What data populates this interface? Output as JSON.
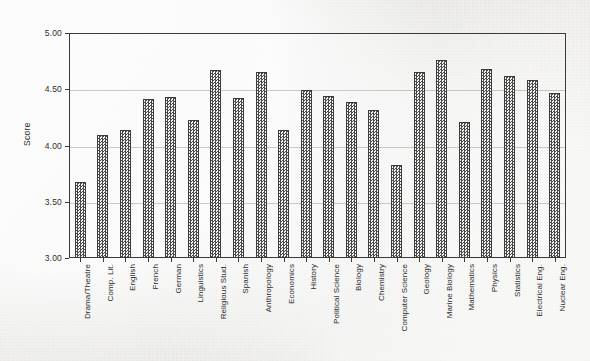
{
  "chart_data": {
    "type": "bar",
    "title": "",
    "xlabel": "",
    "ylabel": "Score",
    "ylim": [
      3.0,
      5.0
    ],
    "yticks": [
      "3.00",
      "3.50",
      "4.00",
      "4.50",
      "5.00"
    ],
    "ytick_values": [
      3.0,
      3.5,
      4.0,
      4.5,
      5.0
    ],
    "grid": true,
    "legend": "none",
    "categories": [
      "Drama/Theatre",
      "Comp. Lit.",
      "English",
      "French",
      "German",
      "Linguistics",
      "Religious Stud.",
      "Spanish",
      "Anthropology",
      "Economics",
      "History",
      "Political Science",
      "Biology",
      "Chemistry",
      "Computer Science",
      "Geology",
      "Marine Biology",
      "Mathematics",
      "Physics",
      "Statistics",
      "Electrical Eng.",
      "Nuclear Eng."
    ],
    "values": [
      3.68,
      4.09,
      4.14,
      4.41,
      4.43,
      4.23,
      4.67,
      4.42,
      4.65,
      4.14,
      4.49,
      4.44,
      4.39,
      4.32,
      3.83,
      4.65,
      4.76,
      4.21,
      4.68,
      4.62,
      4.58,
      4.47
    ]
  },
  "style": {
    "bar_edge_color": "#3b3b3b",
    "bar_fill_color": "#4a4a4a",
    "axis_color": "#3a3a3a",
    "grid_color": "#5a5a5a",
    "background_color": "#eeedeb",
    "text_color": "#2b2b2b"
  }
}
